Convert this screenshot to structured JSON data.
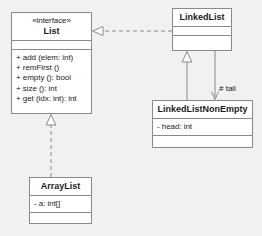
{
  "diagram": {
    "type": "uml-class-diagram",
    "background_color": "#f1f1f1",
    "box_fill": "#ffffff",
    "line_color": "#8a8a8a",
    "text_color": "#1b1b1b"
  },
  "classes": {
    "list": {
      "stereotype": "«interface»",
      "name": "List",
      "attributes": [],
      "methods": [
        "+ add (elem: int)",
        "+ remFirst ()",
        "+ empty (): bool",
        "+ size (): int",
        "+ get (idx: int): int"
      ]
    },
    "linked_list": {
      "name": "LinkedList",
      "attributes": [],
      "methods": []
    },
    "linked_list_non_empty": {
      "name": "LinkedListNonEmpty",
      "attributes": [
        "- head: int"
      ],
      "methods": []
    },
    "array_list": {
      "name": "ArrayList",
      "attributes": [
        "- a: int[]"
      ],
      "methods": []
    }
  },
  "relations": {
    "linkedlist_realizes_list": {
      "kind": "realization",
      "from": "LinkedList",
      "to": "List",
      "style": "dashed",
      "arrowhead": "hollow-triangle"
    },
    "arraylist_realizes_list": {
      "kind": "realization",
      "from": "ArrayList",
      "to": "List",
      "style": "dashed",
      "arrowhead": "hollow-triangle"
    },
    "nonempty_extends_linkedlist": {
      "kind": "generalization",
      "from": "LinkedListNonEmpty",
      "to": "LinkedList",
      "style": "solid",
      "arrowhead": "hollow-triangle"
    },
    "tail_association": {
      "kind": "association",
      "from": "LinkedList",
      "to": "LinkedListNonEmpty",
      "style": "solid",
      "arrowhead": "open-arrow",
      "label": "# tail"
    }
  }
}
